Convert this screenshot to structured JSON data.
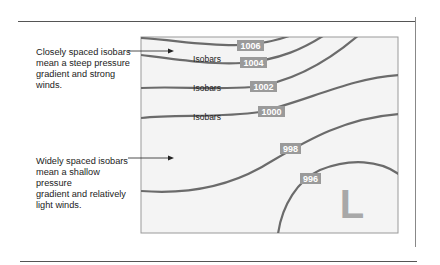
{
  "diagram": {
    "annotations": {
      "close": "Closely spaced isobars\nmean a steep pressure\ngradient and strong\nwinds.",
      "wide": "Widely spaced isobars\nmean a shallow pressure\ngradient and relatively\nlight winds."
    },
    "line_labels": [
      "Isobars",
      "Isobars",
      "Isobars"
    ],
    "isobars": [
      {
        "value": "1006"
      },
      {
        "value": "1004"
      },
      {
        "value": "1002"
      },
      {
        "value": "1000"
      },
      {
        "value": "998"
      },
      {
        "value": "996"
      }
    ],
    "low_pressure_marker": "L",
    "colors": {
      "isobar_line": "#6b6b6b",
      "label_bg": "#9a9a9a",
      "label_text": "#ffffff",
      "low_marker": "#a8a8a8",
      "map_bg": "#f4f4f4",
      "map_border": "#9a9a9a"
    }
  }
}
